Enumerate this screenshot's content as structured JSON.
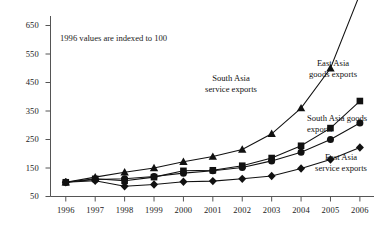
{
  "chart_data": {
    "type": "line",
    "title": "",
    "subtitle": "",
    "note": "1996 values are indexed to 100",
    "xlabel": "",
    "ylabel": "",
    "categories": [
      "1996",
      "1997",
      "1998",
      "1999",
      "2000",
      "2001",
      "2002",
      "2003",
      "2004",
      "2005",
      "2006"
    ],
    "x": [
      1996,
      1997,
      1998,
      1999,
      2000,
      2001,
      2002,
      2003,
      2004,
      2005,
      2006
    ],
    "ylim": [
      50,
      650
    ],
    "yticks": [
      50,
      150,
      250,
      350,
      450,
      550,
      650
    ],
    "grid": false,
    "legend": "annotations-inline",
    "series": [
      {
        "name": "South Asia service exports",
        "marker": "triangle",
        "values": [
          100,
          118,
          135,
          150,
          172,
          190,
          215,
          270,
          360,
          500,
          760
        ]
      },
      {
        "name": "East Asia goods exports",
        "marker": "square",
        "values": [
          100,
          112,
          105,
          118,
          140,
          142,
          158,
          185,
          228,
          290,
          385
        ]
      },
      {
        "name": "South Asia goods exports",
        "marker": "circle",
        "values": [
          100,
          110,
          112,
          120,
          132,
          140,
          152,
          175,
          205,
          250,
          308
        ]
      },
      {
        "name": "East Asia service exports",
        "marker": "diamond",
        "values": [
          100,
          105,
          86,
          92,
          102,
          104,
          112,
          122,
          148,
          180,
          222
        ]
      }
    ],
    "annotations": [
      {
        "id": "south-asia-service-exports-label",
        "text_line1": "South Asia",
        "text_line2": "service exports"
      },
      {
        "id": "east-asia-goods-exports-label",
        "text_line1": "East Asia",
        "text_line2": "goods exports"
      },
      {
        "id": "south-asia-goods-exports-label",
        "text_line1": "South Asia goods",
        "text_line2": "exports"
      },
      {
        "id": "east-asia-service-exports-label",
        "text_line1": "East Asia",
        "text_line2": "service exports"
      }
    ],
    "colors": {
      "line": "#111111",
      "axis": "#555555",
      "text": "#1a1a1a"
    }
  }
}
